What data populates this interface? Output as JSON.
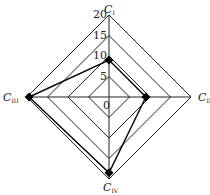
{
  "chart_data": {
    "type": "radar",
    "title": "",
    "axes": [
      "C_I",
      "C_II",
      "C_III",
      "C_IV"
    ],
    "axis_labels": [
      {
        "main": "C",
        "sub": "I"
      },
      {
        "main": "C",
        "sub": "II"
      },
      {
        "main": "C",
        "sub": "III"
      },
      {
        "main": "C",
        "sub": "IV"
      }
    ],
    "ticks": [
      0,
      5,
      10,
      15,
      20
    ],
    "tick_labels": [
      "0",
      "5",
      "10",
      "15",
      "20"
    ],
    "range": [
      0,
      20
    ],
    "grid_shape": "diamond",
    "series": [
      {
        "name": "series-1",
        "values": [
          9,
          9,
          19.5,
          18.5
        ],
        "marker": "diamond",
        "color": "#000000"
      }
    ]
  },
  "style": {
    "grid_color": "#222222",
    "series_color": "#000000"
  }
}
